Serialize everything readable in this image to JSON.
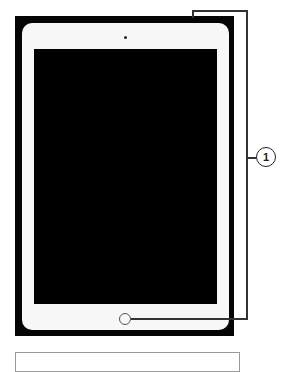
{
  "diagram": {
    "callouts": [
      {
        "number": "1",
        "targets": [
          "top-edge",
          "home-button"
        ]
      }
    ],
    "colors": {
      "frame": "#050505",
      "bezel": "#f7f7f7",
      "screen": "#000000",
      "callout_line": "#333333"
    }
  }
}
